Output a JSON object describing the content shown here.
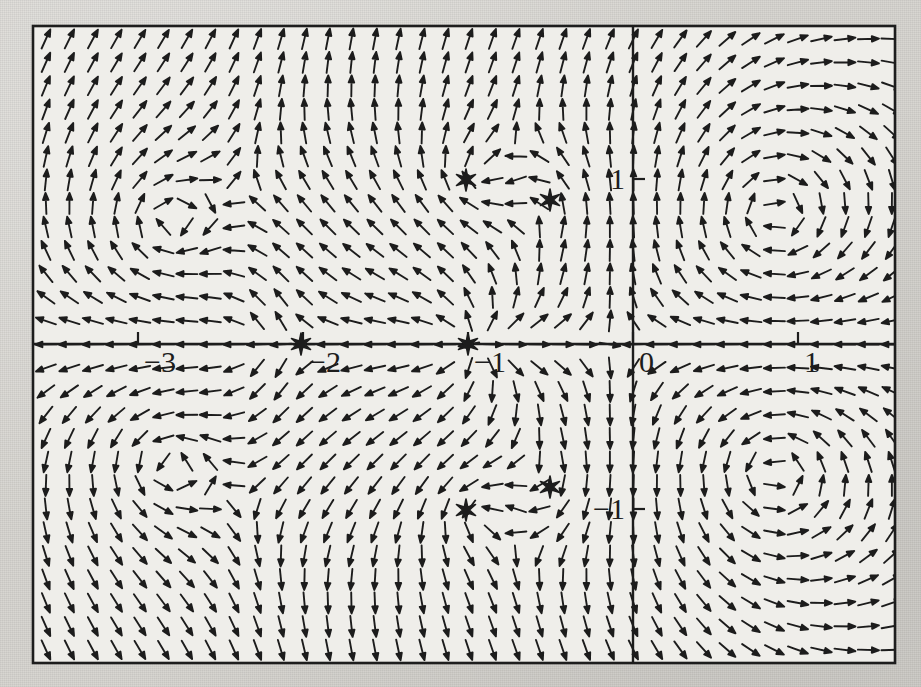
{
  "figure": {
    "kind": "direction-field",
    "background_paper_color": "#d6d4cf",
    "plot_background_color": "#efeeea",
    "ink_color": "#1d1d1d",
    "frame": {
      "x": 33,
      "y": 26,
      "width": 862,
      "height": 637
    }
  },
  "chart_data": {
    "type": "scatter",
    "subtype": "vector-field-quiver",
    "title": "",
    "subtitle": "",
    "xlabel": "",
    "ylabel": "",
    "grid": false,
    "legend": false,
    "legend_position": "none",
    "axes": {
      "x_axis_visible": true,
      "y_axis_visible": true,
      "x_axis_y_value": 0,
      "y_axis_x_value": 0,
      "xlim": [
        -3.636,
        1.591
      ],
      "ylim": [
        -1.921,
        1.921
      ],
      "x_ticks": [
        -3,
        -2,
        -1,
        0,
        1
      ],
      "x_tick_labels": [
        "−3",
        "−2",
        "−1",
        "0",
        "1"
      ],
      "y_ticks": [
        -1,
        1
      ],
      "y_tick_labels": [
        "−1",
        "1"
      ],
      "tick_direction": "in",
      "tick_length_px": 12,
      "x_tick_label_side": "below-right",
      "y_tick_label_side": "left"
    },
    "pixel_mapping": {
      "x_origin_px": 633,
      "y_origin_px": 344,
      "px_per_unit_x": 165,
      "px_per_unit_y": 165
    },
    "quiver": {
      "grid_spacing_px": 23.5,
      "arrow_length_px": 21,
      "arrow_head_length_px": 7,
      "arrow_head_width_px": 5.5,
      "line_width_px": 1.9,
      "normalized": true,
      "description": "Unit-length direction arrows sampled on a regular rectangular grid across the whole frame."
    },
    "field": {
      "notation": "dx/dt = P(x,y), dy/dt = Q(x,y)",
      "critical_point_marker": "six-pointed-star",
      "critical_points": [
        {
          "label": "saddle",
          "x": -2.0,
          "y": 0.0,
          "px": [
            301,
            344
          ]
        },
        {
          "label": "source",
          "x": -1.0,
          "y": 0.0,
          "px": [
            468,
            344
          ]
        },
        {
          "label": "spiral-upper-left",
          "x": -1.012,
          "y": 0.994,
          "px": [
            466,
            180
          ]
        },
        {
          "label": "spiral-upper-right",
          "x": -0.503,
          "y": 0.873,
          "px": [
            550,
            200
          ]
        },
        {
          "label": "spiral-lower-left",
          "x": -1.012,
          "y": -1.006,
          "px": [
            466,
            510
          ]
        },
        {
          "label": "spiral-lower-right",
          "x": -0.503,
          "y": -0.867,
          "px": [
            550,
            487
          ]
        }
      ],
      "vortex_centers": [
        {
          "x": -2.85,
          "y": 0.72,
          "sense": "clockwise",
          "strength": 1.05
        },
        {
          "x": -2.85,
          "y": -0.72,
          "sense": "counter-clockwise",
          "strength": 1.05
        },
        {
          "x": -1.0,
          "y": 1.0,
          "sense": "clockwise",
          "strength": 0.62
        },
        {
          "x": -1.0,
          "y": -1.0,
          "sense": "counter-clockwise",
          "strength": 0.62
        },
        {
          "x": -0.5,
          "y": 0.87,
          "sense": "counter-clockwise",
          "strength": 0.34
        },
        {
          "x": -0.5,
          "y": -0.87,
          "sense": "clockwise",
          "strength": 0.34
        },
        {
          "x": 0.85,
          "y": 0.78,
          "sense": "clockwise",
          "strength": 0.95
        },
        {
          "x": 0.85,
          "y": -0.78,
          "sense": "counter-clockwise",
          "strength": 0.95
        }
      ],
      "sources": [
        {
          "x": -1.0,
          "y": 0.0,
          "strength": 1.3
        }
      ],
      "saddles": [
        {
          "x": -2.0,
          "y": 0.0,
          "strength": 1.1,
          "stable_axis": "x",
          "unstable_axis": "y"
        }
      ],
      "uniform_drift": {
        "dx": 0.3,
        "dy": 0.0
      }
    },
    "x": [],
    "values": [],
    "categories": []
  },
  "markers": {
    "star_outer_radius_px": 11,
    "star_inner_radius_px": 3.4,
    "star_points": 6
  }
}
